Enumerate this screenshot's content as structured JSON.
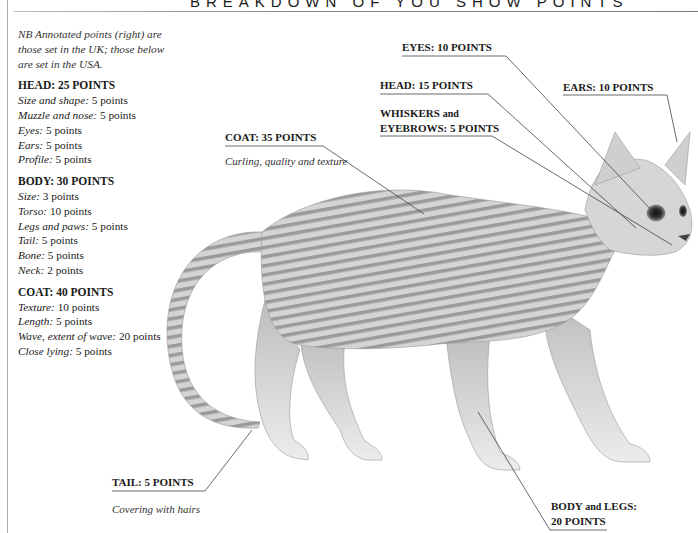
{
  "title": "BREAKDOWN OF YOU SHOW POINTS",
  "sidebar": {
    "note": "NB Annotated points (right) are those set in the UK; those below are set in the USA.",
    "sections": [
      {
        "heading": "HEAD: 25 POINTS",
        "items": [
          {
            "key": "Size and shape",
            "value": "5 points"
          },
          {
            "key": "Muzzle and nose",
            "value": "5 points"
          },
          {
            "key": "Eyes",
            "value": "5 points"
          },
          {
            "key": "Ears",
            "value": "5 points"
          },
          {
            "key": "Profile",
            "value": "5 points"
          }
        ]
      },
      {
        "heading": "BODY: 30 POINTS",
        "items": [
          {
            "key": "Size",
            "value": "3 points"
          },
          {
            "key": "Torso",
            "value": "10 points"
          },
          {
            "key": "Legs and paws",
            "value": "5 points"
          },
          {
            "key": "Tail",
            "value": "5 points"
          },
          {
            "key": "Bone",
            "value": "5 points"
          },
          {
            "key": "Neck",
            "value": "2 points"
          }
        ]
      },
      {
        "heading": "COAT: 40 POINTS",
        "items": [
          {
            "key": "Texture",
            "value": "10 points"
          },
          {
            "key": "Length",
            "value": "5 points"
          },
          {
            "key": "Wave, extent of wave",
            "value": "20 points"
          },
          {
            "key": "Close lying",
            "value": "5 points"
          }
        ]
      }
    ]
  },
  "annotations": {
    "eyes": "EYES: 10 POINTS",
    "head": "HEAD: 15 POINTS",
    "ears": "EARS: 10 POINTS",
    "whiskers_line1_a": "WHISKERS",
    "whiskers_line1_b": "and",
    "whiskers_line2": "EYEBROWS: 5 POINTS",
    "coat": "COAT: 35 POINTS",
    "coat_sub": "Curling, quality and texture",
    "tail": "TAIL: 5 POINTS",
    "tail_sub": "Covering with hairs",
    "body_line1_a": "BODY",
    "body_line1_b": "and",
    "body_line1_c": "LEGS:",
    "body_line2": "20 POINTS"
  },
  "illustration": {
    "subject": "cornish-rex-cat",
    "caption": ""
  }
}
